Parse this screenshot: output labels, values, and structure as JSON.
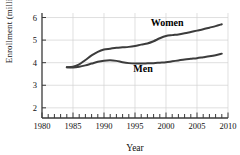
{
  "chart_data": {
    "type": "line",
    "title": "",
    "xlabel": "Year",
    "ylabel": "Enrollment (millions)",
    "xlim": [
      1980,
      2010
    ],
    "ylim": [
      1.55,
      6.2
    ],
    "grid": true,
    "legend_position": "inline-labels",
    "x_ticks_major": [
      1980,
      1985,
      1990,
      1995,
      2000,
      2005,
      2010
    ],
    "x_tick_labels": [
      "1980",
      "1985",
      "1990",
      "1995",
      "2000",
      "2005",
      "2010"
    ],
    "x_ticks_minor_step": 1,
    "y_ticks": [
      2,
      3,
      4,
      5,
      6
    ],
    "y_tick_labels": [
      "2",
      "3",
      "4",
      "5",
      "6"
    ],
    "series": [
      {
        "name": "Women",
        "label": "Women",
        "color": "#3c3c3c",
        "label_x": 2000.2,
        "label_y": 5.62,
        "x": [
          1984,
          1985,
          1986,
          1987,
          1988,
          1989,
          1990,
          1991,
          1992,
          1993,
          1994,
          1995,
          1996,
          1997,
          1998,
          1999,
          2000,
          2001,
          2002,
          2003,
          2004,
          2005,
          2006,
          2007,
          2008,
          2009
        ],
        "values": [
          3.8,
          3.82,
          3.92,
          4.12,
          4.32,
          4.48,
          4.58,
          4.62,
          4.66,
          4.68,
          4.7,
          4.74,
          4.8,
          4.85,
          4.95,
          5.08,
          5.18,
          5.22,
          5.25,
          5.3,
          5.36,
          5.42,
          5.48,
          5.55,
          5.62,
          5.7
        ]
      },
      {
        "name": "Men",
        "label": "Men",
        "color": "#3c3c3c",
        "label_x": 1996.3,
        "label_y": 3.6,
        "x": [
          1984,
          1985,
          1986,
          1987,
          1988,
          1989,
          1990,
          1991,
          1992,
          1993,
          1994,
          1995,
          1996,
          1997,
          1998,
          1999,
          2000,
          2001,
          2002,
          2003,
          2004,
          2005,
          2006,
          2007,
          2008,
          2009
        ],
        "values": [
          3.8,
          3.79,
          3.82,
          3.88,
          3.96,
          4.04,
          4.09,
          4.11,
          4.08,
          4.02,
          3.98,
          3.96,
          3.96,
          3.97,
          3.98,
          4.0,
          4.02,
          4.06,
          4.1,
          4.14,
          4.17,
          4.2,
          4.24,
          4.28,
          4.33,
          4.4
        ]
      }
    ]
  }
}
